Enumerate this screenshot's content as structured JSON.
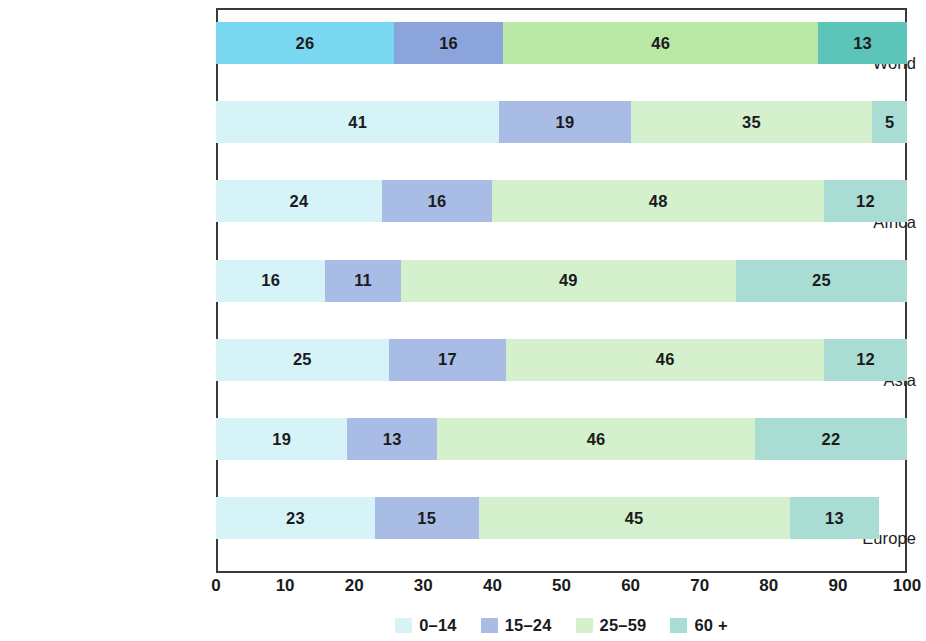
{
  "chart_data": {
    "type": "bar",
    "subtype": "horizontal-100-percent-stacked",
    "title": "",
    "xlabel": "",
    "ylabel": "",
    "xlim": [
      0,
      100
    ],
    "xticks": [
      0,
      10,
      20,
      30,
      40,
      50,
      60,
      70,
      80,
      90,
      100
    ],
    "grid": false,
    "legend_position": "bottom",
    "categories": [
      "World",
      "Africa",
      "Asia",
      "Europe",
      "Latin America and the\nCaribbean",
      "Northern America",
      "Oceania"
    ],
    "series": [
      {
        "name": "0–14",
        "values": [
          26,
          41,
          24,
          16,
          25,
          19,
          23
        ]
      },
      {
        "name": "15–24",
        "values": [
          16,
          19,
          16,
          11,
          17,
          13,
          15
        ]
      },
      {
        "name": "25–59",
        "values": [
          46,
          35,
          48,
          49,
          46,
          46,
          45
        ]
      },
      {
        "name": "60 +",
        "values": [
          13,
          5,
          12,
          25,
          12,
          22,
          13
        ]
      }
    ],
    "colors": {
      "0-14": "#d6f3f7",
      "15-24": "#a9bce6",
      "25-59": "#d4f0cd",
      "60 +": "#a9ddd4"
    },
    "highlight_row": "World",
    "highlight_colors": {
      "0-14": "#79d7f0",
      "15-24": "#8ba5dc",
      "25-59": "#b9e8a5",
      "60 +": "#5cc4b8"
    }
  },
  "rows": [
    {
      "label": "World",
      "label_lines": [
        "World"
      ],
      "highlight": true,
      "segments": [
        {
          "group": "0–14",
          "value": 26,
          "label": "26",
          "color": "#79d7f0"
        },
        {
          "group": "15–24",
          "value": 16,
          "label": "16",
          "color": "#8ba5dc"
        },
        {
          "group": "25–59",
          "value": 46,
          "label": "46",
          "color": "#b9e8a5"
        },
        {
          "group": "60 +",
          "value": 13,
          "label": "13",
          "color": "#5cc4b8"
        }
      ]
    },
    {
      "label": "Africa",
      "label_lines": [
        "Africa"
      ],
      "highlight": false,
      "segments": [
        {
          "group": "0–14",
          "value": 41,
          "label": "41",
          "color": "#d6f3f7"
        },
        {
          "group": "15–24",
          "value": 19,
          "label": "19",
          "color": "#a9bce6"
        },
        {
          "group": "25–59",
          "value": 35,
          "label": "35",
          "color": "#d4f0cd"
        },
        {
          "group": "60 +",
          "value": 5,
          "label": "5",
          "color": "#a9ddd4"
        }
      ]
    },
    {
      "label": "Asia",
      "label_lines": [
        "Asia"
      ],
      "highlight": false,
      "segments": [
        {
          "group": "0–14",
          "value": 24,
          "label": "24",
          "color": "#d6f3f7"
        },
        {
          "group": "15–24",
          "value": 16,
          "label": "16",
          "color": "#a9bce6"
        },
        {
          "group": "25–59",
          "value": 48,
          "label": "48",
          "color": "#d4f0cd"
        },
        {
          "group": "60 +",
          "value": 12,
          "label": "12",
          "color": "#a9ddd4"
        }
      ]
    },
    {
      "label": "Europe",
      "label_lines": [
        "Europe"
      ],
      "highlight": false,
      "segments": [
        {
          "group": "0–14",
          "value": 16,
          "label": "16",
          "color": "#d6f3f7"
        },
        {
          "group": "15–24",
          "value": 11,
          "label": "11",
          "color": "#a9bce6"
        },
        {
          "group": "25–59",
          "value": 49,
          "label": "49",
          "color": "#d4f0cd"
        },
        {
          "group": "60 +",
          "value": 25,
          "label": "25",
          "color": "#a9ddd4"
        }
      ]
    },
    {
      "label": "Latin America and the Caribbean",
      "label_lines": [
        "Latin America and the",
        "Caribbean"
      ],
      "highlight": false,
      "segments": [
        {
          "group": "0–14",
          "value": 25,
          "label": "25",
          "color": "#d6f3f7"
        },
        {
          "group": "15–24",
          "value": 17,
          "label": "17",
          "color": "#a9bce6"
        },
        {
          "group": "25–59",
          "value": 46,
          "label": "46",
          "color": "#d4f0cd"
        },
        {
          "group": "60 +",
          "value": 12,
          "label": "12",
          "color": "#a9ddd4"
        }
      ]
    },
    {
      "label": "Northern America",
      "label_lines": [
        "Northern America"
      ],
      "highlight": false,
      "segments": [
        {
          "group": "0–14",
          "value": 19,
          "label": "19",
          "color": "#d6f3f7"
        },
        {
          "group": "15–24",
          "value": 13,
          "label": "13",
          "color": "#a9bce6"
        },
        {
          "group": "25–59",
          "value": 46,
          "label": "46",
          "color": "#d4f0cd"
        },
        {
          "group": "60 +",
          "value": 22,
          "label": "22",
          "color": "#a9ddd4"
        }
      ]
    },
    {
      "label": "Oceania",
      "label_lines": [
        "Oceania"
      ],
      "highlight": false,
      "segments": [
        {
          "group": "0–14",
          "value": 23,
          "label": "23",
          "color": "#d6f3f7"
        },
        {
          "group": "15–24",
          "value": 15,
          "label": "15",
          "color": "#a9bce6"
        },
        {
          "group": "25–59",
          "value": 45,
          "label": "45",
          "color": "#d4f0cd"
        },
        {
          "group": "60 +",
          "value": 13,
          "label": "13",
          "color": "#a9ddd4"
        }
      ]
    }
  ],
  "axis": {
    "ticks": [
      "0",
      "10",
      "20",
      "30",
      "40",
      "50",
      "60",
      "70",
      "80",
      "90",
      "100"
    ],
    "tick_values": [
      0,
      10,
      20,
      30,
      40,
      50,
      60,
      70,
      80,
      90,
      100
    ]
  },
  "legend": {
    "items": [
      {
        "label": "0–14",
        "color": "#d6f3f7"
      },
      {
        "label": "15–24",
        "color": "#a9bce6"
      },
      {
        "label": "25–59",
        "color": "#d4f0cd"
      },
      {
        "label": "60 +",
        "color": "#a9ddd4"
      }
    ]
  }
}
